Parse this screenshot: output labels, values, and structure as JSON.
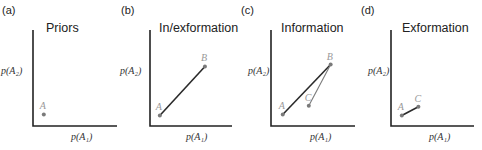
{
  "figure": {
    "panels": [
      {
        "id": "a",
        "label": "(a)",
        "title": "Priors",
        "xlabel": "p(A₁)",
        "ylabel": "p(A₂)",
        "points": [
          {
            "name": "A",
            "x": 0.12,
            "y": 0.12
          }
        ],
        "segments": []
      },
      {
        "id": "b",
        "label": "(b)",
        "title": "In/exformation",
        "xlabel": "p(A₁)",
        "ylabel": "p(A₂)",
        "points": [
          {
            "name": "A",
            "x": 0.12,
            "y": 0.11
          },
          {
            "name": "B",
            "x": 0.67,
            "y": 0.62
          }
        ],
        "segments": [
          {
            "from": "A",
            "to": "B",
            "style": "dark"
          }
        ]
      },
      {
        "id": "c",
        "label": "(c)",
        "title": "Information",
        "xlabel": "p(A₁)",
        "ylabel": "p(A₂)",
        "points": [
          {
            "name": "A",
            "x": 0.14,
            "y": 0.12
          },
          {
            "name": "B",
            "x": 0.71,
            "y": 0.64
          },
          {
            "name": "C",
            "x": 0.45,
            "y": 0.21
          }
        ],
        "segments": [
          {
            "from": "A",
            "to": "B",
            "style": "dark"
          },
          {
            "from": "C",
            "to": "B",
            "style": "light"
          }
        ]
      },
      {
        "id": "d",
        "label": "(d)",
        "title": "Exformation",
        "xlabel": "p(A₁)",
        "ylabel": "p(A₂)",
        "points": [
          {
            "name": "A",
            "x": 0.13,
            "y": 0.11
          },
          {
            "name": "C",
            "x": 0.33,
            "y": 0.2
          }
        ],
        "segments": [
          {
            "from": "A",
            "to": "C",
            "style": "dark"
          }
        ]
      }
    ]
  }
}
